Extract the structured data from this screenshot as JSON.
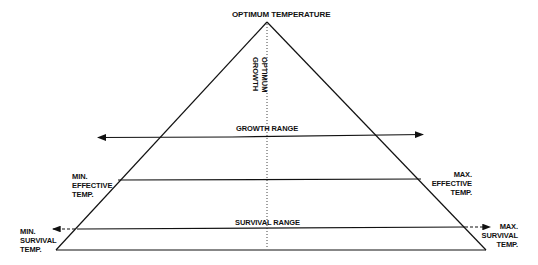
{
  "diagram": {
    "title_label": "OPTIMUM TEMPERATURE",
    "optimum_growth_lines": [
      "OPTIMUM",
      "GROWTH"
    ],
    "growth_range_label": "GROWTH RANGE",
    "survival_range_label": "SURVIVAL RANGE",
    "min_effective": [
      "MIN.",
      "EFFECTIVE",
      "TEMP."
    ],
    "max_effective": [
      "MAX.",
      "EFFECTIVE",
      "TEMP."
    ],
    "min_survival": [
      "MIN.",
      "SURVIVAL",
      "TEMP."
    ],
    "max_survival": [
      "MAX.",
      "SURVIVAL",
      "TEMP."
    ],
    "line_color": "#111111"
  }
}
